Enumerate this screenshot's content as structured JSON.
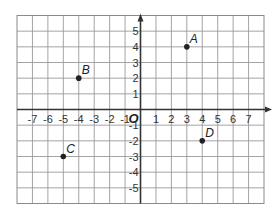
{
  "diagram": {
    "type": "coordinate-plane",
    "origin_label": "O",
    "x_range": [
      -8,
      8
    ],
    "y_range": [
      -6,
      6
    ],
    "x_tick_labels": [
      "-7",
      "-6",
      "-5",
      "-4",
      "-3",
      "-2",
      "-1",
      "1",
      "2",
      "3",
      "4",
      "5",
      "6",
      "7"
    ],
    "y_tick_labels": [
      "5",
      "4",
      "3",
      "2",
      "1",
      "-1",
      "-2",
      "-3",
      "-4",
      "-5"
    ],
    "points": [
      {
        "label": "A",
        "x": 3,
        "y": 4
      },
      {
        "label": "B",
        "x": -4,
        "y": 2
      },
      {
        "label": "C",
        "x": -5,
        "y": -3
      },
      {
        "label": "D",
        "x": 4,
        "y": -2
      }
    ],
    "colors": {
      "grid": "#9a9a9a",
      "axis": "#333333",
      "point": "#222222"
    }
  }
}
